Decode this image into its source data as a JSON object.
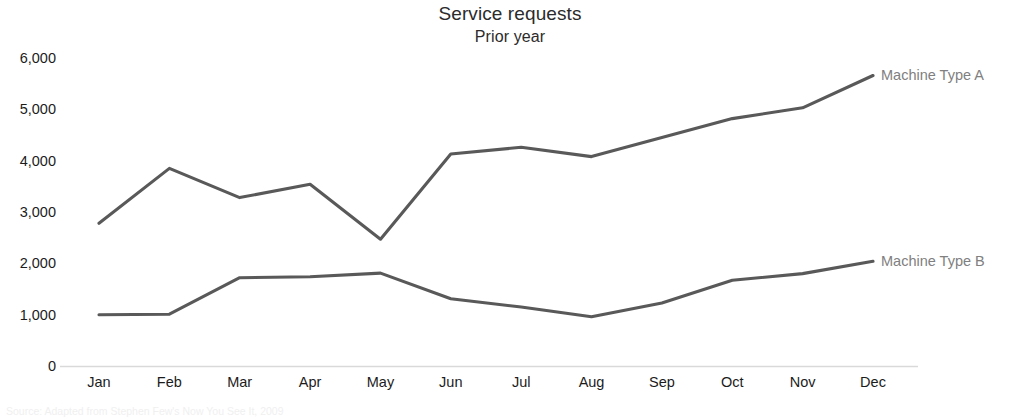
{
  "header": {
    "title": "Service requests",
    "subtitle": "Prior year"
  },
  "source_note": "Source: Adapted from Stephen Few's Now You See It, 2009",
  "axis": {
    "y_ticks": [
      "0",
      "1,000",
      "2,000",
      "3,000",
      "4,000",
      "5,000",
      "6,000"
    ],
    "x_ticks": [
      "Jan",
      "Feb",
      "Mar",
      "Apr",
      "May",
      "Jun",
      "Jul",
      "Aug",
      "Sep",
      "Oct",
      "Nov",
      "Dec"
    ]
  },
  "series_labels": {
    "a": "Machine Type A",
    "b": "Machine Type B"
  },
  "colors": {
    "line": "#595959",
    "label": "#808080",
    "axis": "#d9d9d9",
    "tick_text": "#1c1c1c",
    "title": "#2b2b2b"
  },
  "chart_data": {
    "type": "line",
    "title": "Service requests",
    "subtitle": "Prior year",
    "xlabel": "",
    "ylabel": "",
    "ylim": [
      0,
      6000
    ],
    "ytick_values": [
      0,
      1000,
      2000,
      3000,
      4000,
      5000,
      6000
    ],
    "grid": false,
    "legend_position": "right-inline-labels",
    "categories": [
      "Jan",
      "Feb",
      "Mar",
      "Apr",
      "May",
      "Jun",
      "Jul",
      "Aug",
      "Sep",
      "Oct",
      "Nov",
      "Dec"
    ],
    "series": [
      {
        "name": "Machine Type A",
        "color": "#595959",
        "values": [
          2780,
          3850,
          3280,
          3540,
          2470,
          4130,
          4260,
          4080,
          4450,
          4820,
          5030,
          5660
        ]
      },
      {
        "name": "Machine Type B",
        "color": "#595959",
        "values": [
          1000,
          1010,
          1720,
          1740,
          1810,
          1310,
          1150,
          960,
          1230,
          1670,
          1800,
          2040
        ]
      }
    ]
  }
}
